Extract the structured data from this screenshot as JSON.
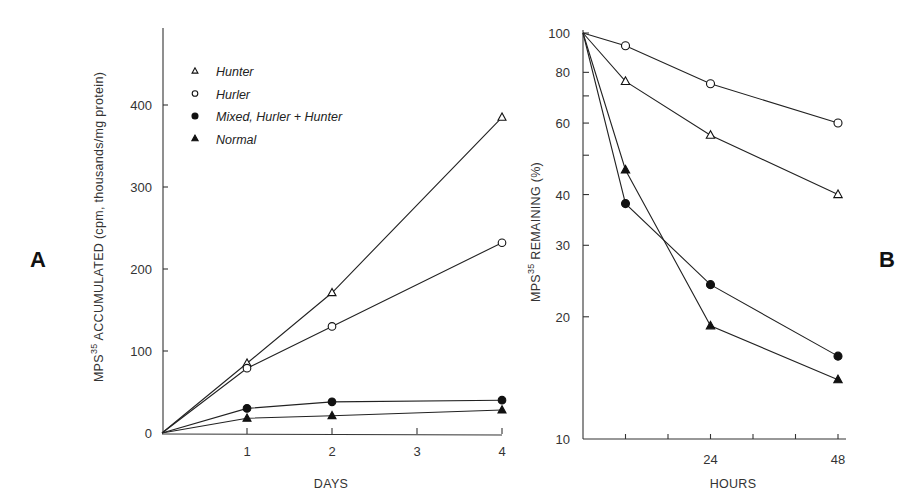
{
  "panels": {
    "a": {
      "label": "A"
    },
    "b": {
      "label": "B"
    }
  },
  "legend": {
    "items": [
      {
        "name": "Hunter",
        "marker": "open-triangle"
      },
      {
        "name": "Hurler",
        "marker": "open-circle"
      },
      {
        "name": "Mixed, Hurler + Hunter",
        "marker": "filled-circle"
      },
      {
        "name": "Normal",
        "marker": "filled-triangle"
      }
    ]
  },
  "chart_data": [
    {
      "panel": "A",
      "type": "line",
      "title": "",
      "xlabel": "DAYS",
      "ylabel": "MPS³⁵ ACCUMULATED (cpm, thousands/mg protein)",
      "ylabel_parts": {
        "prefix": "MPS",
        "sup": "35",
        "rest": " ACCUMULATED (cpm, thousands/mg protein)"
      },
      "x": [
        0,
        1,
        2,
        4
      ],
      "xticks": [
        1,
        2,
        3,
        4
      ],
      "yticks": [
        0,
        100,
        200,
        300,
        400
      ],
      "xlim": [
        0,
        4
      ],
      "ylim": [
        0,
        450
      ],
      "grid": false,
      "legend_position": "upper left",
      "series": [
        {
          "name": "Hunter",
          "marker": "open-triangle",
          "values": [
            0,
            85,
            171,
            385
          ]
        },
        {
          "name": "Hurler",
          "marker": "open-circle",
          "values": [
            0,
            79,
            130,
            232
          ]
        },
        {
          "name": "Mixed, Hurler + Hunter",
          "marker": "filled-circle",
          "values": [
            0,
            30,
            38,
            40
          ]
        },
        {
          "name": "Normal",
          "marker": "filled-triangle",
          "values": [
            0,
            18,
            21,
            28
          ]
        }
      ]
    },
    {
      "panel": "B",
      "type": "line",
      "title": "",
      "xlabel": "HOURS",
      "ylabel": "MPS³⁵ REMAINING (%)",
      "ylabel_parts": {
        "prefix": "MPS",
        "sup": "35",
        "rest": " REMAINING (%)"
      },
      "yscale": "log",
      "x": [
        0,
        8,
        24,
        48
      ],
      "xticks_labeled": [
        24,
        48
      ],
      "xticks_minor": [
        8,
        16,
        32,
        40
      ],
      "yticks": [
        10,
        20,
        30,
        40,
        60,
        80,
        100
      ],
      "yticks_minor": [
        50,
        70
      ],
      "xlim": [
        0,
        48
      ],
      "ylim": [
        10,
        100
      ],
      "grid": false,
      "series": [
        {
          "name": "Hurler",
          "marker": "open-circle",
          "values": [
            100,
            93,
            75,
            60
          ]
        },
        {
          "name": "Hunter",
          "marker": "open-triangle",
          "values": [
            100,
            76,
            56,
            40
          ]
        },
        {
          "name": "Mixed, Hurler + Hunter",
          "marker": "filled-circle",
          "values": [
            100,
            38,
            24,
            16
          ]
        },
        {
          "name": "Normal",
          "marker": "filled-triangle",
          "values": [
            100,
            46,
            19,
            14
          ]
        }
      ]
    }
  ]
}
